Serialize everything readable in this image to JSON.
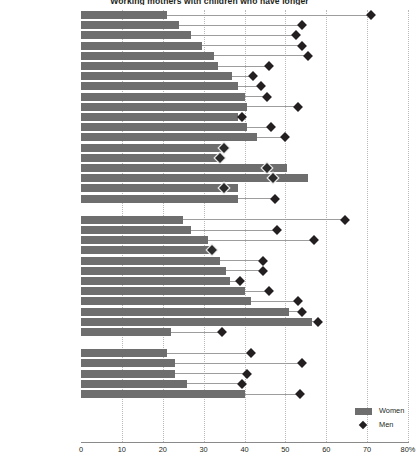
{
  "chart_data": {
    "type": "bar",
    "title": "Working mothers with children who have longer",
    "xlabel": "",
    "ylabel": "",
    "xlim": [
      0,
      80
    ],
    "xticks": [
      0,
      10,
      20,
      30,
      40,
      50,
      60,
      70,
      80
    ],
    "xtick_labels": [
      "0",
      "10",
      "20",
      "30",
      "40",
      "50",
      "60",
      "70",
      "80%"
    ],
    "grid": true,
    "legend_position": "bottom-right",
    "series": [
      {
        "name": "Women",
        "marker": "bar",
        "color": "#6e6e6e"
      },
      {
        "name": "Men",
        "marker": "diamond",
        "color": "#231f20"
      }
    ],
    "groups": [
      {
        "name": "EU15",
        "categories": [
          "Italy",
          "Greece",
          "Spain",
          "Belgium",
          "France",
          "Netherlands",
          "Austria",
          "Germany",
          "Luxembourg",
          "Ireland",
          "United Kingdom",
          "Portugal",
          "Finland",
          "Switzerland",
          "Sweden",
          "Denmark",
          "Norway",
          "Iceland",
          "EU15"
        ],
        "women": [
          21.0,
          24.0,
          27.0,
          29.5,
          32.5,
          33.5,
          37.0,
          38.5,
          40.0,
          40.5,
          38.5,
          40.5,
          43.0,
          35.0,
          34.0,
          50.5,
          55.5,
          38.5,
          38.5
        ],
        "men": [
          71.0,
          54.0,
          52.5,
          54.0,
          55.5,
          46.0,
          42.0,
          44.0,
          45.5,
          53.0,
          39.5,
          46.5,
          50.0,
          35.0,
          34.0,
          45.5,
          47.0,
          35.0,
          47.5
        ]
      },
      {
        "name": "New member states",
        "categories": [
          "Malta",
          "Slovenia",
          "Cyprus",
          "Hungary",
          "Czech Republic",
          "Romania",
          "Bulgaria",
          "Slovakia",
          "Lithuania",
          "Latvia",
          "Estonia",
          "Poland"
        ],
        "women": [
          25.0,
          27.0,
          31.0,
          32.5,
          34.0,
          35.5,
          36.5,
          40.0,
          41.5,
          51.0,
          56.5,
          22.0
        ],
        "men": [
          64.5,
          48.0,
          57.0,
          32.0,
          44.5,
          44.5,
          39.0,
          46.0,
          53.0,
          54.0,
          58.0,
          34.5
        ]
      },
      {
        "name": "Candidate and other countries",
        "categories": [
          "Macedonia FYR",
          "Bosnia & Herzegovina",
          "Serbia",
          "Croatia",
          "Russian Federation"
        ],
        "women": [
          21.0,
          23.0,
          23.0,
          26.0,
          40.0
        ],
        "men": [
          41.5,
          54.0,
          40.5,
          39.5,
          53.5
        ]
      }
    ]
  },
  "legend": {
    "women_label": "Women",
    "men_label": "Men"
  }
}
